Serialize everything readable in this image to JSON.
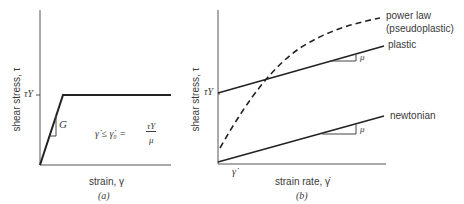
{
  "panel_a": {
    "caption": "(a)",
    "ylabel": "shear stress, τ",
    "xlabel": "strain, γ",
    "yield_tick": "τY",
    "modulus_label": "G",
    "equation": "γ̇ ≤ γ̇₀ = τY / μ",
    "eq_lhs": "γ̇ ≤ γ̇₀ =",
    "eq_num": "τY",
    "eq_den": "μ"
  },
  "panel_b": {
    "caption": "(b)",
    "ylabel": "shear stress, τ",
    "xlabel": "strain rate, γ̇",
    "yield_tick": "τY",
    "x_tick": "γ̇",
    "curves": [
      {
        "name": "power law",
        "sub": "(pseudoplastic)",
        "style": "dashed"
      },
      {
        "name": "plastic",
        "slope_label": "μ",
        "style": "solid"
      },
      {
        "name": "newtonian",
        "slope_label": "μ",
        "style": "solid"
      }
    ]
  },
  "colors": {
    "line": "#222222",
    "axis": "#444444",
    "text": "#3a3a3a"
  }
}
